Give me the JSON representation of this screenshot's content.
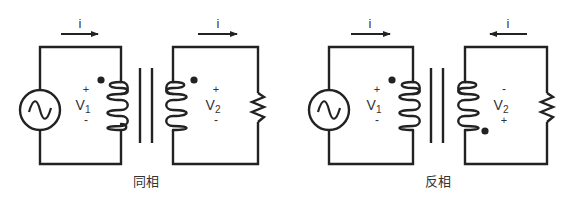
{
  "diagrams": [
    {
      "name": "in-phase",
      "caption": "同相",
      "primary": {
        "current_label": "i",
        "current_direction": "right",
        "voltage_label": "V",
        "voltage_subscript": "1",
        "polarity_top": "+",
        "polarity_bottom": "-",
        "dot_position": "top"
      },
      "secondary": {
        "current_label": "i",
        "current_direction": "right",
        "voltage_label": "V",
        "voltage_subscript": "2",
        "polarity_top": "+",
        "polarity_bottom": "-",
        "dot_position": "top"
      }
    },
    {
      "name": "anti-phase",
      "caption": "反相",
      "primary": {
        "current_label": "i",
        "current_direction": "right",
        "voltage_label": "V",
        "voltage_subscript": "1",
        "polarity_top": "+",
        "polarity_bottom": "-",
        "dot_position": "top"
      },
      "secondary": {
        "current_label": "i",
        "current_direction": "left",
        "voltage_label": "V",
        "voltage_subscript": "2",
        "polarity_top": "-",
        "polarity_bottom": "+",
        "dot_position": "bottom"
      }
    }
  ],
  "colors": {
    "line": "#222222",
    "text": "#333333",
    "background": "#ffffff"
  }
}
